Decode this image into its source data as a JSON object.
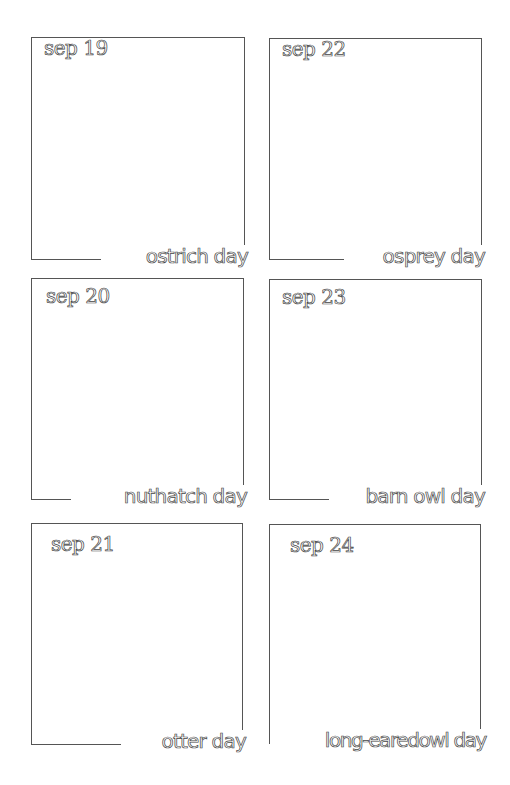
{
  "page": {
    "background": "#ffffff",
    "ink_color": "#444444"
  },
  "boxes": [
    {
      "date": "sep 19",
      "caption": "ostrich day"
    },
    {
      "date": "sep 22",
      "caption": "osprey day"
    },
    {
      "date": "sep 20",
      "caption": "nuthatch day"
    },
    {
      "date": "sep 23",
      "caption": "barn owl day"
    },
    {
      "date": "sep 21",
      "caption": "otter day"
    },
    {
      "date": "sep 24",
      "caption": "long-earedowl day"
    }
  ]
}
